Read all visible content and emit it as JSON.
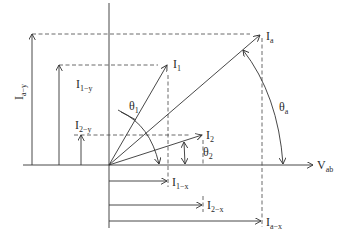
{
  "diagram": {
    "type": "phasor-diagram",
    "reference_axis": {
      "label_main": "V",
      "label_sub": "ab"
    },
    "phasors": [
      {
        "id": "Ia",
        "label_main": "I",
        "label_sub": "a",
        "angle_label_main": "θ",
        "angle_label_sub": "a",
        "x_component": {
          "label_main": "I",
          "label_sub": "a−x"
        },
        "y_component": {
          "label_main": "I",
          "label_sub": "a−y"
        }
      },
      {
        "id": "I1",
        "label_main": "I",
        "label_sub": "1",
        "angle_label_main": "θ",
        "angle_label_sub": "1",
        "x_component": {
          "label_main": "I",
          "label_sub": "1−x"
        },
        "y_component": {
          "label_main": "I",
          "label_sub": "1−y"
        }
      },
      {
        "id": "I2",
        "label_main": "I",
        "label_sub": "2",
        "angle_label_main": "θ",
        "angle_label_sub": "2",
        "x_component": {
          "label_main": "I",
          "label_sub": "2−x"
        },
        "y_component": {
          "label_main": "I",
          "label_sub": "2−y"
        }
      }
    ],
    "colors": {
      "line": "#333333",
      "background": "#ffffff"
    }
  }
}
